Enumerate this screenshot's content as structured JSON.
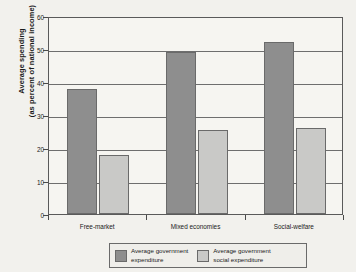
{
  "chart_data": {
    "type": "bar",
    "title": "",
    "xlabel": "",
    "ylabel_line1": "Average spending",
    "ylabel_line2": "(as percent of national income)",
    "categories": [
      "Free-market",
      "Mixed economies",
      "Social-welfare"
    ],
    "series": [
      {
        "name_line1": "Average government",
        "name_line2": "expenditure",
        "color": "#8e8e8e",
        "values": [
          38,
          49,
          52
        ]
      },
      {
        "name_line1": "Average government",
        "name_line2": "social expenditure",
        "color": "#c9c9c7",
        "values": [
          18,
          25.5,
          26
        ]
      }
    ],
    "ylim": [
      0,
      60
    ],
    "yticks": [
      0,
      10,
      20,
      30,
      40,
      50,
      60
    ],
    "ytick_labels": [
      "0",
      "10",
      "20",
      "30",
      "40",
      "50",
      "60"
    ],
    "grid": true,
    "legend_position": "bottom"
  },
  "colors": {
    "background": "#f2f1ed",
    "plot_background": "#f6f5f1",
    "axis": "#5a5a5a",
    "gridline": "#6e6e6e",
    "text": "#1a1a1a"
  }
}
